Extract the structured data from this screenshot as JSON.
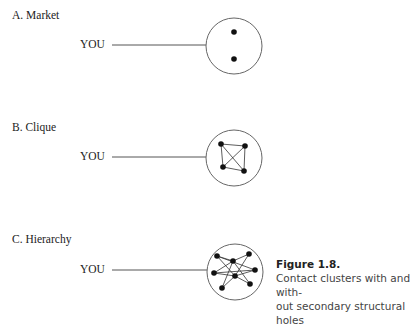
{
  "panels": [
    {
      "id": "A",
      "label": "A. Market",
      "you": "YOU",
      "circle": {
        "cx": 234,
        "cy": 46,
        "r": 28
      },
      "line": {
        "x1": 112,
        "x2": 206,
        "y": 45
      },
      "nodes": [
        [
          234,
          32
        ],
        [
          234,
          59
        ]
      ],
      "edges": []
    },
    {
      "id": "B",
      "label": "B. Clique",
      "you": "YOU",
      "circle": {
        "cx": 234,
        "cy": 158,
        "r": 28
      },
      "line": {
        "x1": 112,
        "x2": 206,
        "y": 157
      },
      "nodes": [
        [
          221,
          144
        ],
        [
          245,
          146
        ],
        [
          223,
          167
        ],
        [
          244,
          171
        ]
      ],
      "edges": [
        [
          0,
          1
        ],
        [
          0,
          2
        ],
        [
          0,
          3
        ],
        [
          1,
          2
        ],
        [
          1,
          3
        ],
        [
          2,
          3
        ]
      ]
    },
    {
      "id": "C",
      "label": "C. Hierarchy",
      "you": "YOU",
      "circle": {
        "cx": 235,
        "cy": 272,
        "r": 28
      },
      "line": {
        "x1": 112,
        "x2": 207,
        "y": 270
      },
      "nodes": [
        [
          217,
          256
        ],
        [
          249,
          254
        ],
        [
          233,
          261
        ],
        [
          214,
          273
        ],
        [
          255,
          270
        ],
        [
          235,
          276
        ],
        [
          222,
          288
        ],
        [
          250,
          284
        ]
      ],
      "edges": [
        [
          0,
          2
        ],
        [
          0,
          4
        ],
        [
          1,
          2
        ],
        [
          1,
          5
        ],
        [
          2,
          3
        ],
        [
          2,
          7
        ],
        [
          3,
          5
        ],
        [
          3,
          4
        ],
        [
          5,
          6
        ],
        [
          5,
          4
        ],
        [
          6,
          2
        ],
        [
          5,
          7
        ],
        [
          0,
          5
        ]
      ]
    }
  ],
  "caption": {
    "title": "Figure 1.8.",
    "line1": "Contact clusters with and with-",
    "line2": "out secondary structural holes"
  }
}
